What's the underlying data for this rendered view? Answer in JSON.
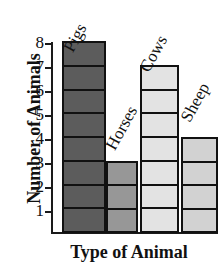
{
  "chart_data": {
    "type": "bar",
    "title": "",
    "xlabel": "Type of Animal",
    "ylabel": "Number of Animals",
    "categories": [
      "Pigs",
      "Horses",
      "Cows",
      "Sheep"
    ],
    "values": [
      8,
      3,
      7,
      4
    ],
    "ylim": [
      0,
      8
    ],
    "yticks": [
      1,
      2,
      3,
      4,
      5,
      6,
      7,
      8
    ],
    "ytick_labels": [
      "1",
      "2",
      "3",
      "4",
      "5",
      "6",
      "7",
      "8"
    ],
    "grid": false,
    "legend": "none",
    "segmented_bars": true,
    "bar_colors": [
      "#5c5c5c",
      "#979797",
      "#e3e3e3",
      "#d2d2d2"
    ],
    "bar_border_color": "#111111",
    "axis_color": "#1a1a1a",
    "background_color": "#ffffff",
    "series": [
      {
        "name": "Number of Animals",
        "points": [
          {
            "category": "Pigs",
            "value": 8,
            "color": "#5c5c5c"
          },
          {
            "category": "Horses",
            "value": 3,
            "color": "#979797"
          },
          {
            "category": "Cows",
            "value": 7,
            "color": "#e3e3e3"
          },
          {
            "category": "Sheep",
            "value": 4,
            "color": "#d2d2d2"
          }
        ]
      }
    ]
  },
  "layout": {
    "bars": [
      {
        "left": 10,
        "width": 44,
        "label_left": 16,
        "label_top": 22
      },
      {
        "left": 54,
        "width": 32,
        "label_left": 58,
        "label_top": 120
      },
      {
        "left": 88,
        "width": 39,
        "label_left": 92,
        "label_top": 42
      },
      {
        "left": 129,
        "width": 37,
        "label_left": 133,
        "label_top": 92
      }
    ],
    "ytick_tops": [
      211,
      187,
      163,
      139,
      115,
      91,
      67,
      43
    ]
  }
}
